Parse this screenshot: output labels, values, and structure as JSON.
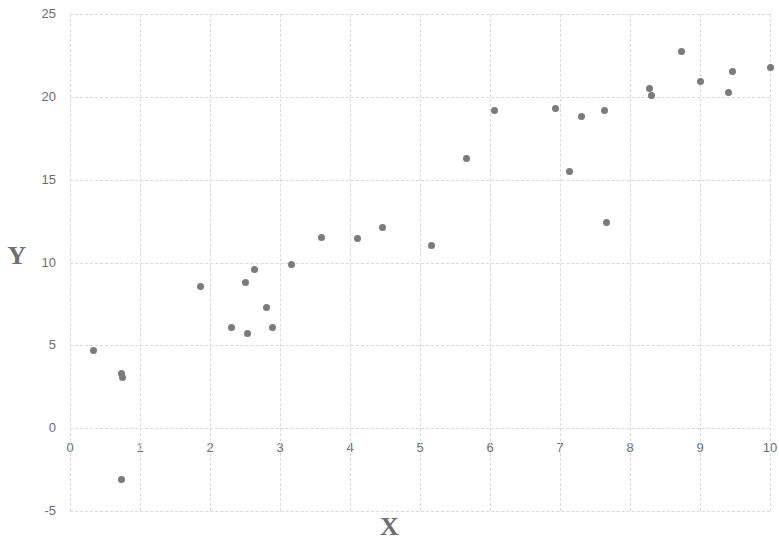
{
  "chart_data": {
    "type": "scatter",
    "title": "",
    "xlabel": "X",
    "ylabel": "Y",
    "xlim": [
      0,
      10
    ],
    "ylim": [
      -5,
      25
    ],
    "xticks": [
      0,
      1,
      2,
      3,
      4,
      5,
      6,
      7,
      8,
      9,
      10
    ],
    "yticks": [
      -5,
      0,
      5,
      10,
      15,
      20,
      25
    ],
    "xtick_labels": [
      "0",
      "1",
      "2",
      "3",
      "4",
      "5",
      "6",
      "7",
      "8",
      "9",
      "10"
    ],
    "ytick_labels": [
      "-5",
      "0",
      "5",
      "10",
      "15",
      "20",
      "25"
    ],
    "grid": true,
    "grid_style": "dashed",
    "grid_color": "#d9d9d9",
    "legend": null,
    "marker": "circle",
    "marker_color": "#7b7b7b",
    "marker_size": 7,
    "series": [
      {
        "name": "data",
        "points": [
          [
            0.33,
            4.7
          ],
          [
            0.74,
            3.3
          ],
          [
            0.75,
            3.05
          ],
          [
            0.73,
            -3.1
          ],
          [
            1.87,
            8.55
          ],
          [
            2.3,
            6.05
          ],
          [
            2.5,
            8.8
          ],
          [
            2.54,
            5.7
          ],
          [
            2.63,
            9.55
          ],
          [
            2.81,
            7.3
          ],
          [
            2.89,
            6.05
          ],
          [
            3.16,
            9.85
          ],
          [
            3.59,
            11.5
          ],
          [
            4.11,
            11.45
          ],
          [
            4.47,
            12.1
          ],
          [
            5.17,
            11.05
          ],
          [
            5.67,
            16.3
          ],
          [
            6.06,
            19.2
          ],
          [
            6.94,
            19.3
          ],
          [
            7.14,
            15.5
          ],
          [
            7.3,
            18.8
          ],
          [
            7.63,
            19.15
          ],
          [
            7.66,
            12.4
          ],
          [
            8.28,
            20.5
          ],
          [
            8.3,
            20.1
          ],
          [
            8.73,
            22.75
          ],
          [
            9.0,
            20.9
          ],
          [
            9.41,
            20.25
          ],
          [
            9.46,
            21.5
          ],
          [
            10.0,
            21.8
          ]
        ]
      }
    ]
  },
  "labels": {
    "x_axis_title": "X",
    "y_axis_title": "Y"
  }
}
